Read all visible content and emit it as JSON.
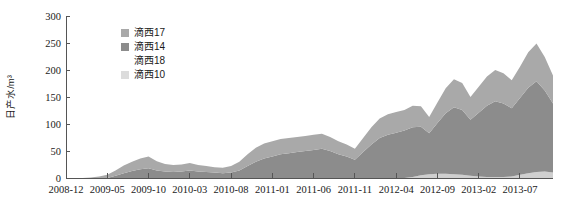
{
  "chart_data": {
    "type": "area",
    "stacked": true,
    "title": "",
    "xlabel": "",
    "ylabel": "日产水/m³",
    "ylim": [
      0,
      300
    ],
    "yticks": [
      0,
      50,
      100,
      150,
      200,
      250,
      300
    ],
    "grid": false,
    "legend_position": "top-left-inside",
    "x": [
      "2008-12",
      "2009-01",
      "2009-02",
      "2009-03",
      "2009-04",
      "2009-05",
      "2009-06",
      "2009-07",
      "2009-08",
      "2009-09",
      "2009-10",
      "2009-11",
      "2009-12",
      "2010-01",
      "2010-02",
      "2010-03",
      "2010-04",
      "2010-05",
      "2010-06",
      "2010-07",
      "2010-08",
      "2010-09",
      "2010-10",
      "2010-11",
      "2010-12",
      "2011-01",
      "2011-02",
      "2011-03",
      "2011-04",
      "2011-05",
      "2011-06",
      "2011-07",
      "2011-08",
      "2011-09",
      "2011-10",
      "2011-11",
      "2011-12",
      "2012-01",
      "2012-02",
      "2012-03",
      "2012-04",
      "2012-05",
      "2012-06",
      "2012-07",
      "2012-08",
      "2012-09",
      "2012-10",
      "2012-11",
      "2012-12",
      "2013-01",
      "2013-02",
      "2013-03",
      "2013-04",
      "2013-05",
      "2013-06",
      "2013-07",
      "2013-08",
      "2013-09",
      "2013-10",
      "2013-11"
    ],
    "xtick_labels": [
      "2008-12",
      "2009-05",
      "2009-10",
      "2010-03",
      "2010-08",
      "2011-01",
      "2011-06",
      "2011-11",
      "2012-04",
      "2012-09",
      "2013-02",
      "2013-07"
    ],
    "xtick_indices": [
      0,
      5,
      10,
      15,
      20,
      25,
      30,
      35,
      40,
      45,
      50,
      55
    ],
    "series": [
      {
        "name": "滴西14",
        "color": "#8c8c8c",
        "values": [
          0,
          0,
          0,
          0,
          0,
          0,
          4,
          9,
          13,
          16,
          18,
          14,
          12,
          11,
          12,
          14,
          12,
          11,
          10,
          9,
          10,
          14,
          22,
          30,
          36,
          40,
          44,
          46,
          48,
          50,
          52,
          54,
          50,
          44,
          40,
          34,
          48,
          62,
          74,
          80,
          84,
          88,
          92,
          90,
          76,
          94,
          112,
          124,
          120,
          104,
          118,
          132,
          140,
          136,
          126,
          142,
          158,
          168,
          150,
          128
        ]
      },
      {
        "name": "滴西17",
        "color": "#a9a9a9",
        "values": [
          0,
          0,
          0,
          1,
          3,
          6,
          10,
          14,
          17,
          20,
          22,
          17,
          14,
          13,
          13,
          14,
          12,
          11,
          10,
          10,
          12,
          16,
          22,
          26,
          28,
          28,
          28,
          28,
          28,
          28,
          28,
          28,
          26,
          24,
          22,
          20,
          26,
          32,
          36,
          38,
          38,
          38,
          40,
          38,
          30,
          38,
          46,
          52,
          50,
          42,
          48,
          54,
          58,
          56,
          52,
          58,
          66,
          70,
          62,
          52
        ]
      },
      {
        "name": "滴西18",
        "color": "#ffffff",
        "values": [
          0,
          0,
          0,
          0,
          0,
          0,
          0,
          0,
          0,
          0,
          0,
          0,
          0,
          0,
          0,
          0,
          0,
          0,
          0,
          0,
          0,
          0,
          0,
          0,
          0,
          0,
          0,
          0,
          0,
          0,
          0,
          0,
          0,
          0,
          0,
          0,
          0,
          0,
          0,
          0,
          0,
          0,
          0,
          0,
          0,
          0,
          0,
          0,
          0,
          0,
          0,
          0,
          0,
          0,
          0,
          0,
          0,
          0,
          0,
          0
        ]
      },
      {
        "name": "滴西10",
        "color": "#cfcfcf",
        "values": [
          0,
          0,
          0,
          0,
          0,
          0,
          0,
          0,
          0,
          0,
          0,
          0,
          0,
          0,
          0,
          0,
          0,
          0,
          0,
          0,
          0,
          0,
          0,
          0,
          0,
          0,
          0,
          0,
          0,
          0,
          0,
          0,
          0,
          0,
          0,
          0,
          0,
          0,
          0,
          0,
          0,
          0,
          2,
          5,
          7,
          8,
          8,
          7,
          6,
          4,
          3,
          2,
          2,
          2,
          3,
          6,
          9,
          11,
          12,
          10
        ]
      }
    ],
    "legend_entries": [
      {
        "label": "滴西17",
        "color": "#a9a9a9"
      },
      {
        "label": "滴西14",
        "color": "#8c8c8c"
      },
      {
        "label": "滴西18",
        "color": "#ffffff"
      },
      {
        "label": "滴西10",
        "color": "#dcdcdc"
      }
    ]
  }
}
